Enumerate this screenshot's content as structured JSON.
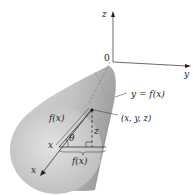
{
  "diagram": {
    "axes": {
      "z_label": "z",
      "y_label": "y",
      "x_label": "x",
      "origin_label": "0"
    },
    "labels": {
      "curve": "y = f(x)",
      "point": "(x, y, z)",
      "slant_side": "f(x)",
      "base_side": "f(x)",
      "angle": "θ",
      "height": "z",
      "x_position": "x"
    },
    "colors": {
      "solid_fill": "#c8c8c8",
      "solid_shadow": "#a8a8a8",
      "axis": "#333333",
      "background": "#ffffff"
    }
  }
}
